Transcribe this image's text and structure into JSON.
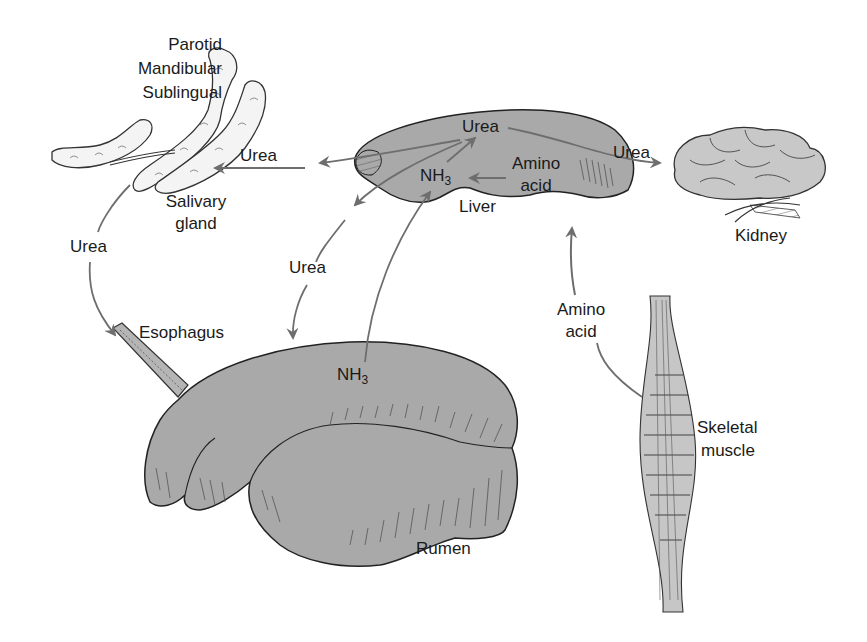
{
  "figure": {
    "type": "urea recycling diagram (ruminant)",
    "colors": {
      "organ_fill": "#a9a9a9",
      "organ_stroke": "#222222",
      "arrow": "#6e6e6e",
      "text": "#1a1a1a",
      "background": "#ffffff"
    }
  },
  "organs": {
    "salivary_gland": {
      "glands_label_1": "Parotid",
      "glands_label_2": "Mandibular",
      "glands_label_3": "Sublingual",
      "name_line_1": "Salivary",
      "name_line_2": "gland"
    },
    "liver": {
      "name": "Liver",
      "urea": "Urea",
      "nh3_main": "NH",
      "nh3_sub": "3",
      "amino_1": "Amino",
      "amino_2": "acid"
    },
    "kidney": {
      "name": "Kidney"
    },
    "rumen": {
      "name": "Rumen",
      "nh3_main": "NH",
      "nh3_sub": "3"
    },
    "esophagus": {
      "name": "Esophagus"
    },
    "skeletal_muscle": {
      "name_line_1": "Skeletal",
      "name_line_2": "muscle"
    }
  },
  "flows": [
    {
      "from": "liver",
      "to": "salivary_gland",
      "label": "Urea"
    },
    {
      "from": "liver",
      "to": "kidney",
      "label": "Urea"
    },
    {
      "from": "salivary_gland",
      "to": "esophagus",
      "label": "Urea"
    },
    {
      "from": "liver",
      "to": "rumen",
      "label": "Urea"
    },
    {
      "from": "rumen",
      "to": "liver",
      "label": "NH3"
    },
    {
      "from": "skeletal_muscle",
      "to": "liver",
      "label_1": "Amino",
      "label_2": "acid"
    }
  ]
}
